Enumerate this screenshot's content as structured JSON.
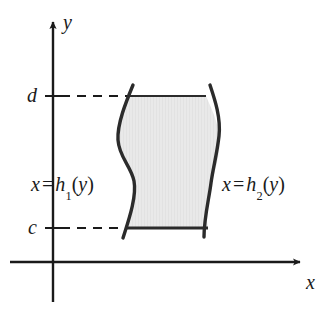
{
  "figure": {
    "background_color": "#ffffff",
    "stroke_color": "#1a1a1a",
    "curve_color": "#2b2b2b",
    "region_fill_color": "#e8e8e8"
  },
  "axes": {
    "y_axis_label": "y",
    "x_axis_label": "x",
    "origin_x": 53,
    "origin_y": 262
  },
  "ticks": {
    "upper_label": "d",
    "lower_label": "c",
    "upper_y": 96,
    "lower_y": 228
  },
  "curves": {
    "left": {
      "var": "x",
      "equals": "=",
      "func": "h",
      "subscript": "1",
      "arg_open": "(",
      "arg": "y",
      "arg_close": ")"
    },
    "right": {
      "var": "x",
      "equals": "=",
      "func": "h",
      "subscript": "2",
      "arg_open": "(",
      "arg": "y",
      "arg_close": ")"
    }
  }
}
